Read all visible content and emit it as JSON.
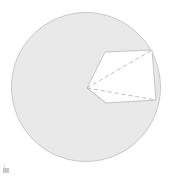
{
  "figure": {
    "title": "",
    "caption": "",
    "type": "geometric-diagram"
  },
  "colors": {
    "background": "#ffffff",
    "disk_fill": "#e9e9e9",
    "disk_stroke": "#c8c8c8",
    "polygon_fill": "#ffffff",
    "polygon_stroke": "#c4c4c4",
    "dashed_stroke": "#c0c0c0",
    "corner_mark": "#c9c9c9"
  },
  "chart_data": {
    "type": "scatter",
    "title": "",
    "xlabel": "",
    "ylabel": "",
    "grid": false,
    "legend": null,
    "circle": {
      "center_x": 86,
      "center_y": 87,
      "radius": 75
    },
    "polygon_vertices": [
      {
        "label": "apex",
        "x": 87,
        "y": 88
      },
      {
        "label": "upper-left",
        "x": 105,
        "y": 52
      },
      {
        "label": "upper-right",
        "x": 152,
        "y": 50
      },
      {
        "label": "lower-right",
        "x": 156,
        "y": 100
      },
      {
        "label": "lower-left",
        "x": 106,
        "y": 103
      }
    ],
    "dashed_chords": [
      {
        "from": "apex",
        "to": "upper-right"
      },
      {
        "from": "apex",
        "to": "lower-right"
      },
      {
        "from": "apex",
        "to": "lower-left"
      }
    ],
    "solid_edges": [
      {
        "from": "apex",
        "to": "upper-left"
      },
      {
        "from": "upper-left",
        "to": "upper-right"
      },
      {
        "from": "upper-right",
        "to": "lower-right"
      },
      {
        "from": "lower-right",
        "to": "lower-left"
      },
      {
        "from": "lower-left",
        "to": "apex"
      }
    ]
  },
  "annotations": {
    "corner_mark_label": "page-corner-mark"
  }
}
